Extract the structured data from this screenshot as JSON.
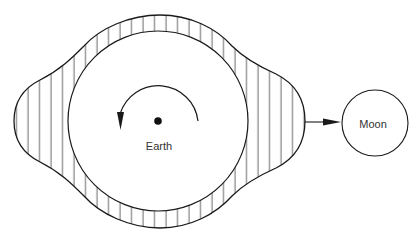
{
  "diagram": {
    "earth": {
      "label": "Earth",
      "center": [
        158,
        121
      ],
      "radius": 90,
      "rotation": "counterclockwise"
    },
    "moon": {
      "label": "Moon",
      "center": [
        375,
        123
      ],
      "radius": 33
    },
    "tidal_bulge": {
      "description": "Hatched water envelope elongated toward and away from the Moon",
      "left_extent_x": 14,
      "right_extent_x": 305,
      "top_y": 15,
      "bottom_y": 228
    },
    "arrow_to_moon": {
      "from": [
        305,
        122
      ],
      "to": [
        340,
        122
      ]
    },
    "colors": {
      "stroke": "#1a1a1a",
      "hatch": "#555555",
      "background": "#ffffff",
      "text": "#333333"
    }
  }
}
